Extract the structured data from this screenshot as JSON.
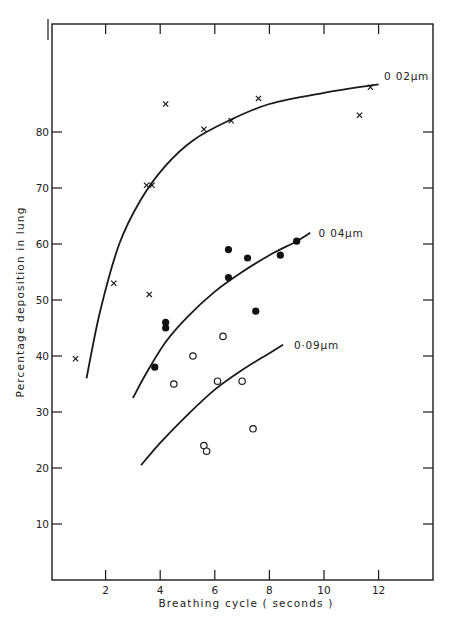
{
  "chart_data": {
    "type": "scatter",
    "title": "",
    "xlabel": "Breathing cycle ( seconds )",
    "ylabel": "Percentage deposition in lung",
    "xlim": [
      0,
      14
    ],
    "ylim": [
      0,
      100
    ],
    "x_ticks": [
      2,
      4,
      6,
      8,
      10,
      12
    ],
    "y_ticks": [
      10,
      20,
      30,
      40,
      50,
      60,
      70,
      80
    ],
    "y_tick_labels": [
      "10",
      "20",
      "30",
      "40",
      "50",
      "60",
      "70",
      "80"
    ],
    "x_tick_labels": [
      "2",
      "4",
      "6",
      "8",
      "10",
      "12"
    ],
    "grid": false,
    "legend": "inline curve labels",
    "series": [
      {
        "name": "0 02µm",
        "marker": "x",
        "points": [
          [
            0.9,
            39.5
          ],
          [
            2.3,
            53
          ],
          [
            3.6,
            51
          ],
          [
            3.5,
            70.5
          ],
          [
            3.7,
            70.5
          ],
          [
            4.2,
            85
          ],
          [
            5.6,
            80.5
          ],
          [
            6.6,
            82
          ],
          [
            7.6,
            86
          ],
          [
            11.3,
            83
          ],
          [
            11.7,
            88
          ]
        ],
        "fit_curve": [
          [
            1.3,
            36
          ],
          [
            1.8,
            48
          ],
          [
            2.5,
            60
          ],
          [
            3.3,
            68
          ],
          [
            4.2,
            74
          ],
          [
            5.2,
            78.5
          ],
          [
            6.5,
            82
          ],
          [
            8,
            85
          ],
          [
            10,
            87
          ],
          [
            12,
            88.5
          ]
        ],
        "label_pos": [
          12.2,
          90
        ]
      },
      {
        "name": "0 04µm",
        "marker": "filled-circle",
        "points": [
          [
            3.8,
            38
          ],
          [
            4.2,
            46
          ],
          [
            4.2,
            45
          ],
          [
            6.5,
            59
          ],
          [
            6.5,
            54
          ],
          [
            7.2,
            57.5
          ],
          [
            7.5,
            48
          ],
          [
            8.4,
            58
          ],
          [
            9.0,
            60.5
          ]
        ],
        "fit_curve": [
          [
            3.0,
            32.5
          ],
          [
            3.5,
            37
          ],
          [
            4.2,
            42.5
          ],
          [
            5.0,
            47
          ],
          [
            6.0,
            51.5
          ],
          [
            7.0,
            55
          ],
          [
            8.0,
            58
          ],
          [
            9.0,
            60.5
          ],
          [
            9.5,
            62
          ]
        ],
        "label_pos": [
          9.8,
          62
        ]
      },
      {
        "name": "0·09µm",
        "marker": "open-circle",
        "points": [
          [
            6.3,
            43.5
          ],
          [
            5.2,
            40
          ],
          [
            4.5,
            35
          ],
          [
            6.1,
            35.5
          ],
          [
            7.0,
            35.5
          ],
          [
            5.6,
            24
          ],
          [
            5.7,
            23
          ],
          [
            7.4,
            27
          ]
        ],
        "fit_curve": [
          [
            3.3,
            20.5
          ],
          [
            4.0,
            24.5
          ],
          [
            5.0,
            29.5
          ],
          [
            6.0,
            34
          ],
          [
            7.0,
            37.5
          ],
          [
            8.0,
            40.5
          ],
          [
            8.5,
            42
          ]
        ],
        "label_pos": [
          8.9,
          42
        ]
      }
    ]
  }
}
